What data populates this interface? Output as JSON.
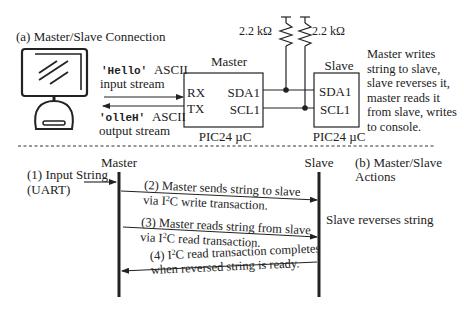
{
  "part_a": {
    "title": "(a) Master/Slave Connection",
    "input_stream": {
      "code": "'Hello'",
      "label": "ASCII",
      "line2": "input stream"
    },
    "output_stream": {
      "code": "'olleH'",
      "label": "ASCII",
      "line2": "output stream"
    },
    "master": {
      "title": "Master",
      "pins_left": [
        "RX",
        "TX"
      ],
      "pins_right": [
        "SDA1",
        "SCL1"
      ],
      "chip": "PIC24 µC"
    },
    "slave": {
      "title": "Slave",
      "pins": [
        "SDA1",
        "SCL1"
      ],
      "chip": "PIC24 µC"
    },
    "resistors": [
      "2.2 kΩ",
      "2.2 kΩ"
    ],
    "description": [
      "Master writes",
      "string to slave,",
      "slave reverses it,",
      "master reads it",
      "from slave, writes",
      "to console."
    ]
  },
  "part_b": {
    "title_lines": [
      "(b) Master/Slave",
      "Actions"
    ],
    "master_label": "Master",
    "slave_label": "Slave",
    "input_lines": [
      "(1) Input String",
      "(UART)"
    ],
    "slave_action": "Slave reverses string",
    "messages": [
      {
        "line1": "(2) Master sends string to slave",
        "line2_pre": "via I",
        "sup": "2",
        "line2_post": "C write transaction.",
        "direction": "master-to-slave"
      },
      {
        "line1": "(3) Master reads string from slave",
        "line2_pre": "via I",
        "sup": "2",
        "line2_post": "C read transaction.",
        "direction": "master-to-slave"
      },
      {
        "line1_pre": "(4) I",
        "sup": "2",
        "line1_post": "C read transaction completes",
        "line2": "when reversed string is ready.",
        "direction": "slave-to-master"
      }
    ]
  }
}
